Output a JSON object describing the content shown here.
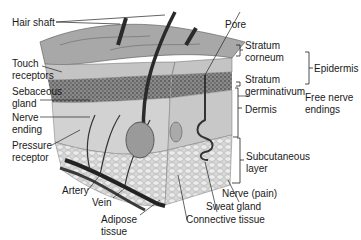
{
  "diagram": {
    "labels_left": [
      {
        "id": "hair-shaft",
        "text": "Hair shaft"
      },
      {
        "id": "touch-receptors",
        "line1": "Touch",
        "line2": "receptors"
      },
      {
        "id": "sebaceous-gland",
        "line1": "Sebaceous",
        "line2": "gland"
      },
      {
        "id": "nerve-ending",
        "line1": "Nerve",
        "line2": "ending"
      },
      {
        "id": "pressure-receptor",
        "line1": "Pressure",
        "line2": "receptor"
      },
      {
        "id": "artery",
        "text": "Artery"
      },
      {
        "id": "vein",
        "text": "Vein"
      }
    ],
    "labels_bottom": [
      {
        "id": "adipose-tissue",
        "line1": "Adipose",
        "line2": "tissue"
      },
      {
        "id": "connective-tissue",
        "text": "Connective tissue"
      },
      {
        "id": "sweat-gland",
        "text": "Sweat gland"
      },
      {
        "id": "nerve-pain",
        "text": "Nerve (pain)"
      }
    ],
    "labels_right": [
      {
        "id": "pore",
        "text": "Pore"
      },
      {
        "id": "stratum-corneum",
        "line1": "Stratum",
        "line2": "corneum"
      },
      {
        "id": "stratum-germinativum",
        "line1": "Stratum",
        "line2": "germinativum"
      },
      {
        "id": "epidermis",
        "text": "Epidermis"
      },
      {
        "id": "free-nerve-endings",
        "line1": "Free nerve",
        "line2": "endings"
      },
      {
        "id": "dermis",
        "text": "Dermis"
      },
      {
        "id": "subcutaneous-layer",
        "line1": "Subcutaneous",
        "line2": "layer"
      }
    ],
    "colors": {
      "surface": "#9a9a9a",
      "epidermis": "#b8b8b8",
      "basal": "#555555",
      "dermis": "#cfcfcf",
      "fat": "#dcdcdc",
      "vessel": "#2a2a2a",
      "line": "#222222"
    }
  }
}
